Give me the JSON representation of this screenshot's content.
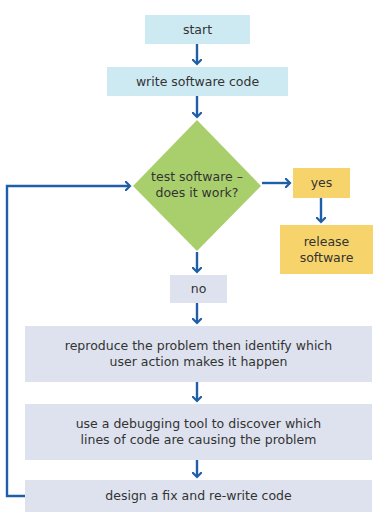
{
  "diagram": {
    "type": "flowchart",
    "colors": {
      "arrow": "#1f5fa8",
      "start_box": "#cdeaf3",
      "decision": "#a9cf6d",
      "yes_box": "#f7d36b",
      "process_box": "#dde2ee"
    },
    "nodes": {
      "start": "start",
      "write_code": "write software code",
      "decision_line1": "test software –",
      "decision_line2": "does it work?",
      "yes": "yes",
      "release_line1": "release",
      "release_line2": "software",
      "no": "no",
      "reproduce_line1": "reproduce the problem then identify which",
      "reproduce_line2": "user action makes it happen",
      "debug_line1": "use a debugging tool to discover which",
      "debug_line2": "lines of code are causing the problem",
      "design_fix": "design a fix and re-write code"
    },
    "edges": [
      {
        "from": "start",
        "to": "write_code"
      },
      {
        "from": "write_code",
        "to": "decision"
      },
      {
        "from": "decision",
        "to": "yes"
      },
      {
        "from": "yes",
        "to": "release"
      },
      {
        "from": "decision",
        "to": "no"
      },
      {
        "from": "no",
        "to": "reproduce"
      },
      {
        "from": "reproduce",
        "to": "debug"
      },
      {
        "from": "debug",
        "to": "design_fix"
      },
      {
        "from": "design_fix",
        "to": "decision",
        "label": "loop back"
      }
    ]
  }
}
